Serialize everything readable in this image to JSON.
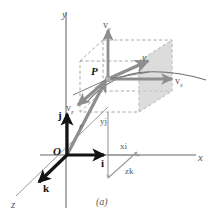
{
  "figure": {
    "caption": "(a)",
    "title": "",
    "axes": {
      "y_label": "y",
      "x_label": "x",
      "z_label": "z"
    },
    "points": {
      "origin_label": "O",
      "particle_label": "P"
    },
    "unit_vectors": [
      {
        "name": "i-unit-vector",
        "label": "i"
      },
      {
        "name": "j-unit-vector",
        "label": "j"
      },
      {
        "name": "k-unit-vector",
        "label": "k"
      }
    ],
    "position_vector": {
      "label": "r",
      "components": [
        {
          "name": "x-component",
          "label_main": "x",
          "label_unit": "i"
        },
        {
          "name": "y-component",
          "label_main": "y",
          "label_unit": "j"
        },
        {
          "name": "z-component",
          "label_main": "z",
          "label_unit": "k"
        }
      ]
    },
    "velocity_vector": {
      "label": "v",
      "components": [
        {
          "name": "vx",
          "label_main": "v",
          "label_sub": "x"
        },
        {
          "name": "vy",
          "label_main": "v",
          "label_sub": "y"
        },
        {
          "name": "vz",
          "label_main": "v",
          "label_sub": "z"
        }
      ]
    },
    "colors": {
      "background": "#ffffff",
      "axis_gray": "#9a9a9a",
      "vector_gray": "#8e8e8e",
      "dashed_gray": "#a8a8a8",
      "plane_fill": "#cfcfcf",
      "unit_vector_black": "#141414",
      "label_gray": "#5a5a5a",
      "curve_gray": "#6f6f6f"
    }
  }
}
